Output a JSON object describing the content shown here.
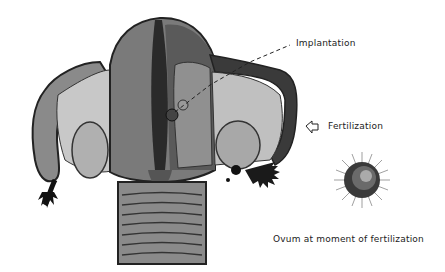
{
  "diagram": {
    "labels": {
      "implantation": "Implantation",
      "fertilization": "Fertilization",
      "ovum_caption": "Ovum at moment of fertilization"
    },
    "colors": {
      "background": "#ffffff",
      "ink": "#222222",
      "dark_tissue": "#3a3a3a",
      "mid_tissue": "#7a7a7a",
      "light_tissue": "#b8b8b8"
    }
  }
}
